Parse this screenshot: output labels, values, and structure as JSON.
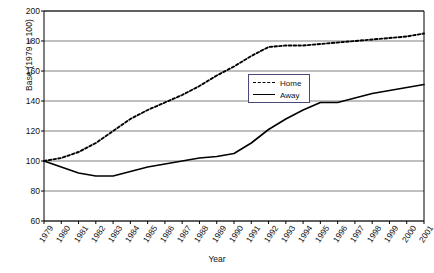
{
  "chart_data": {
    "type": "line",
    "title": "",
    "xlabel": "Year",
    "ylabel": "Base (1979 = 100)",
    "x": [
      1979,
      1980,
      1981,
      1982,
      1983,
      1984,
      1985,
      1986,
      1987,
      1988,
      1989,
      1990,
      1991,
      1992,
      1993,
      1994,
      1995,
      1996,
      1997,
      1998,
      1999,
      2000,
      2001
    ],
    "xtick_labels": [
      "1979",
      "1980",
      "1981",
      "1982",
      "1983",
      "1984",
      "1985",
      "1986",
      "1987",
      "1988",
      "1989",
      "1990",
      "1991",
      "1992",
      "1993",
      "1994",
      "1995",
      "1996",
      "1997",
      "1998",
      "1999",
      "2000",
      "2001"
    ],
    "ytick_labels": [
      "60",
      "80",
      "100",
      "120",
      "140",
      "160",
      "180",
      "200"
    ],
    "yticks": [
      60,
      80,
      100,
      120,
      140,
      160,
      180,
      200
    ],
    "ylim": [
      60,
      200
    ],
    "grid": "horizontal",
    "legend_position": "center-right",
    "series": [
      {
        "name": "Home",
        "style": "dashed",
        "color": "#000000",
        "values": [
          100,
          102,
          106,
          112,
          120,
          128,
          134,
          139,
          144,
          150,
          157,
          163,
          170,
          176,
          177,
          177,
          178,
          179,
          180,
          181,
          182,
          183,
          185
        ]
      },
      {
        "name": "Away",
        "style": "solid",
        "color": "#000000",
        "values": [
          100,
          96,
          92,
          90,
          90,
          93,
          96,
          98,
          100,
          102,
          103,
          105,
          112,
          121,
          128,
          134,
          139,
          139,
          142,
          145,
          147,
          149,
          151
        ]
      }
    ]
  },
  "legend": {
    "items": [
      {
        "label": "Home",
        "style": "dashed"
      },
      {
        "label": "Away",
        "style": "solid"
      }
    ]
  },
  "colors": {
    "axis": "#000000",
    "gridline": "#808080",
    "legend_border": "#4a4a7a",
    "background": "#ffffff"
  }
}
